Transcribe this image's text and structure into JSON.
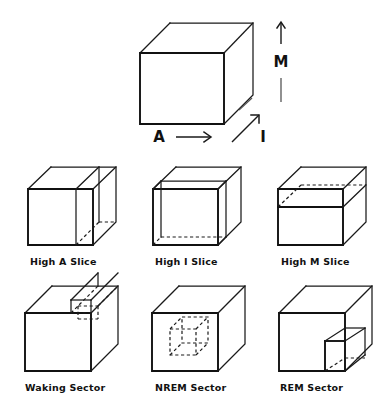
{
  "figure": {
    "line_color": "#1a1a1a",
    "background": "#ffffff"
  },
  "main_cube": {
    "name": "AIM state space cube",
    "axes": [
      {
        "id": "A",
        "label": "A",
        "direction": "horizontal-right",
        "arrow": "→"
      },
      {
        "id": "I",
        "label": "I",
        "direction": "depth-up-right",
        "arrow": "↗"
      },
      {
        "id": "M",
        "label": "M",
        "direction": "vertical-up",
        "arrow": "↑"
      }
    ]
  },
  "panels": [
    {
      "id": "high-a-slice",
      "label": "High A Slice",
      "row": 1,
      "col": 1
    },
    {
      "id": "high-i-slice",
      "label": "High I Slice",
      "row": 1,
      "col": 2
    },
    {
      "id": "high-m-slice",
      "label": "High M Slice",
      "row": 1,
      "col": 3
    },
    {
      "id": "waking-sector",
      "label": "Waking Sector",
      "row": 2,
      "col": 1
    },
    {
      "id": "nrem-sector",
      "label": "NREM Sector",
      "row": 2,
      "col": 2
    },
    {
      "id": "rem-sector",
      "label": "REM Sector",
      "row": 2,
      "col": 3
    }
  ],
  "labels": {
    "axis_a": "A",
    "axis_i": "I",
    "axis_m": "M",
    "high_a_slice": "High A Slice",
    "high_i_slice": "High I Slice",
    "high_m_slice": "High M Slice",
    "waking_sector": "Waking Sector",
    "nrem_sector": "NREM Sector",
    "rem_sector": "REM Sector"
  }
}
